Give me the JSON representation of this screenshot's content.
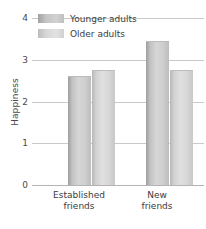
{
  "chart_data": {
    "type": "bar",
    "title": "",
    "xlabel": "",
    "ylabel": "Happiness",
    "ylim": [
      0,
      4
    ],
    "yticks": [
      0,
      1,
      2,
      3,
      4
    ],
    "ytick_labels": [
      "0",
      "1",
      "2",
      "3",
      "4"
    ],
    "grid": true,
    "legend_position": "top-left",
    "categories": [
      "Established friends",
      "New friends"
    ],
    "category_lines": [
      [
        "Established",
        "friends"
      ],
      [
        "New",
        "friends"
      ]
    ],
    "series": [
      {
        "name": "Younger adults",
        "values": [
          2.6,
          3.45
        ],
        "color": "#c2c2c2"
      },
      {
        "name": "Older adults",
        "values": [
          2.75,
          2.75
        ],
        "color": "#d8d8d8"
      }
    ]
  },
  "axis": {
    "y_title": "Happiness"
  },
  "legend": {
    "items": [
      {
        "label": "Younger adults"
      },
      {
        "label": "Older adults"
      }
    ]
  }
}
